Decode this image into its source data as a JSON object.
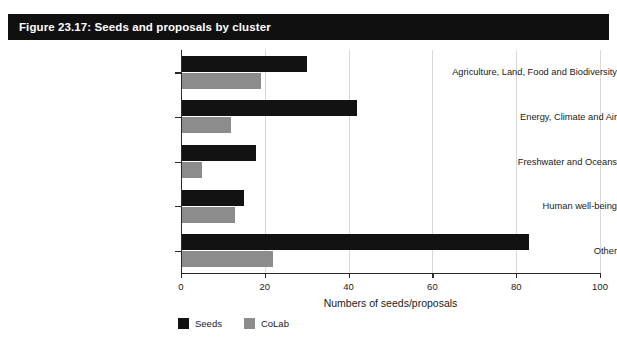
{
  "figure": {
    "title": "Figure 23.17: Seeds and proposals by cluster",
    "title_bar_color": "#101010",
    "title_text_color": "#ffffff",
    "background_color": "#ffffff"
  },
  "chart_data": {
    "type": "bar",
    "orientation": "horizontal",
    "title": "Figure 23.17: Seeds and proposals by cluster",
    "categories": [
      "Agriculture, Land, Food and Biodiversity",
      "Energy, Climate and Air",
      "Freshwater and Oceans",
      "Human well-being",
      "Other"
    ],
    "series": [
      {
        "name": "Seeds",
        "color": "#121212",
        "values": [
          30,
          42,
          18,
          15,
          83
        ]
      },
      {
        "name": "CoLab",
        "color": "#8c8c8c",
        "values": [
          19,
          12,
          5,
          13,
          22
        ]
      }
    ],
    "xlabel": "Numbers of seeds/proposals",
    "ylabel": "",
    "xlim": [
      0,
      100
    ],
    "xticks": [
      0,
      20,
      40,
      60,
      80,
      100
    ],
    "xticklabels": [
      "0",
      "20",
      "40",
      "60",
      "80",
      "100"
    ],
    "grid": "vertical",
    "gridline_color": "#d8d8d8",
    "legend_position": "bottom-left"
  },
  "legend": {
    "items": [
      {
        "label": "Seeds",
        "color": "#121212"
      },
      {
        "label": "CoLab",
        "color": "#8c8c8c"
      }
    ]
  }
}
